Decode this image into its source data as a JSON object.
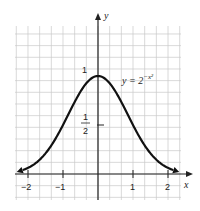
{
  "chart_data": {
    "type": "line",
    "title": "",
    "xlabel": "x",
    "ylabel": "y",
    "annotation": "y = 2^(-x^2)",
    "annotation_parts": {
      "base": "y = 2",
      "exponent": "−x²"
    },
    "function": "2^(-x^2)",
    "xlim": [
      -2.25,
      2.25
    ],
    "ylim": [
      0,
      1
    ],
    "x_ticks": [
      -2,
      -1,
      1,
      2
    ],
    "x_tick_labels": [
      "−2",
      "−1",
      "1",
      "2"
    ],
    "y_ticks": [
      0.5,
      1
    ],
    "y_tick_labels": {
      "half_num": "1",
      "half_den": "2",
      "one": "1"
    },
    "grid": true,
    "arrows_on_curve_ends": true,
    "series": [
      {
        "name": "y = 2^(-x^2)",
        "x": [
          -2.2,
          -2,
          -1.5,
          -1,
          -0.5,
          0,
          0.5,
          1,
          1.5,
          2,
          2.2
        ],
        "values": [
          0.035,
          0.0625,
          0.21,
          0.5,
          0.84,
          1,
          0.84,
          0.5,
          0.21,
          0.0625,
          0.035
        ]
      }
    ]
  },
  "colors": {
    "grid": "#c8c8c8",
    "axis": "#222222",
    "curve": "#111111",
    "background": "#ffffff"
  }
}
